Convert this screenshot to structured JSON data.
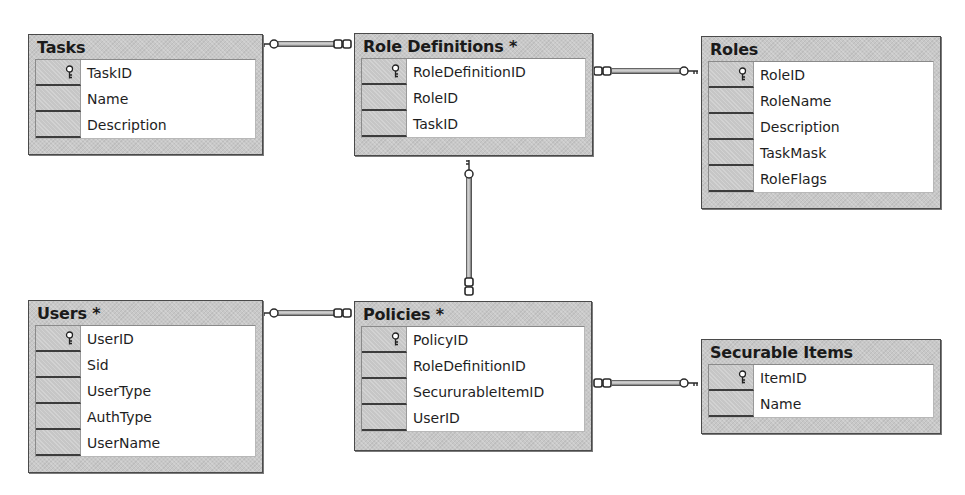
{
  "diagram": {
    "type": "database-relationship-diagram",
    "tables": [
      {
        "id": "tasks",
        "title": "Tasks",
        "modified": false,
        "columns": [
          {
            "name": "TaskID",
            "primary_key": true
          },
          {
            "name": "Name",
            "primary_key": false
          },
          {
            "name": "Description",
            "primary_key": false
          }
        ]
      },
      {
        "id": "role_definitions",
        "title": "Role Definitions *",
        "modified": true,
        "columns": [
          {
            "name": "RoleDefinitionID",
            "primary_key": true
          },
          {
            "name": "RoleID",
            "primary_key": false
          },
          {
            "name": "TaskID",
            "primary_key": false
          }
        ]
      },
      {
        "id": "roles",
        "title": "Roles",
        "modified": false,
        "columns": [
          {
            "name": "RoleID",
            "primary_key": true
          },
          {
            "name": "RoleName",
            "primary_key": false
          },
          {
            "name": "Description",
            "primary_key": false
          },
          {
            "name": "TaskMask",
            "primary_key": false
          },
          {
            "name": "RoleFlags",
            "primary_key": false
          }
        ]
      },
      {
        "id": "users",
        "title": "Users *",
        "modified": true,
        "columns": [
          {
            "name": "UserID",
            "primary_key": true
          },
          {
            "name": "Sid",
            "primary_key": false
          },
          {
            "name": "UserType",
            "primary_key": false
          },
          {
            "name": "AuthType",
            "primary_key": false
          },
          {
            "name": "UserName",
            "primary_key": false
          }
        ]
      },
      {
        "id": "policies",
        "title": "Policies *",
        "modified": true,
        "columns": [
          {
            "name": "PolicyID",
            "primary_key": true
          },
          {
            "name": "RoleDefinitionID",
            "primary_key": false
          },
          {
            "name": "SecururableItemID",
            "primary_key": false
          },
          {
            "name": "UserID",
            "primary_key": false
          }
        ]
      },
      {
        "id": "securable_items",
        "title": "Securable Items",
        "modified": false,
        "columns": [
          {
            "name": "ItemID",
            "primary_key": true
          },
          {
            "name": "Name",
            "primary_key": false
          }
        ]
      }
    ],
    "relationships": [
      {
        "one": "Tasks",
        "many": "Role Definitions"
      },
      {
        "one": "Roles",
        "many": "Role Definitions"
      },
      {
        "one": "Role Definitions",
        "many": "Policies"
      },
      {
        "one": "Users",
        "many": "Policies"
      },
      {
        "one": "Securable Items",
        "many": "Policies"
      }
    ],
    "icons": {
      "primary_key": "key-icon",
      "one_end": "key-icon",
      "many_end": "infinity-icon"
    },
    "colors": {
      "background": "#ffffff",
      "table_frame": "#c8c8c8",
      "border": "#4a4a4a",
      "column_area": "#ffffff",
      "text": "#1e1e1e"
    }
  }
}
